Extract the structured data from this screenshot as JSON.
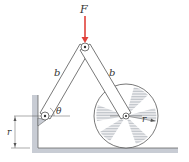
{
  "diagram": {
    "force_label": "F",
    "link_left_label": "b",
    "link_right_label": "b",
    "angle_label": "θ",
    "wheel_radius_label": "r",
    "height_dimension_label": "r",
    "colors": {
      "force_arrow": "#e0413a",
      "link_fill": "#ffffff",
      "line": "#555555",
      "wall_fill": "#c8ccd4",
      "hatch": "#9aa0aa"
    }
  }
}
